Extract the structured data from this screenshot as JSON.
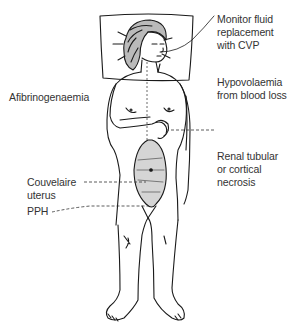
{
  "diagram": {
    "labels": {
      "monitor": [
        "Monitor fluid",
        "replacement",
        "with CVP"
      ],
      "hypovolaemia": [
        "Hypovolaemia",
        "from blood loss"
      ],
      "afibrinogenaemia": [
        "Afibrinogenaemia"
      ],
      "renal": [
        "Renal tubular",
        "or cortical",
        "necrosis"
      ],
      "couvelaire": [
        "Couvelaire",
        "uterus"
      ],
      "pph": [
        "PPH"
      ]
    },
    "colors": {
      "line": "#1a1a1a",
      "text": "#333333",
      "background": "#ffffff"
    }
  }
}
